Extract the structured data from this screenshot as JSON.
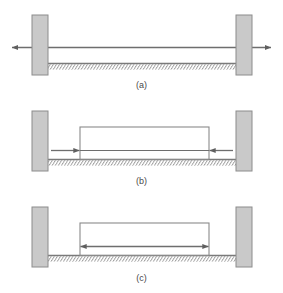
{
  "figure": {
    "title": "",
    "panels": [
      {
        "id": "panel-a",
        "caption": "(a)",
        "description": "unloaded bar between two fixed supports with double-headed axis arrow",
        "arrow_mode": "double-outward-axis",
        "has_member_rect": false
      },
      {
        "id": "panel-b",
        "caption": "(b)",
        "description": "member in compression, arrows point inward toward member ends",
        "arrow_mode": "inward",
        "has_member_rect": true
      },
      {
        "id": "panel-c",
        "caption": "(c)",
        "description": "member in tension, arrows point outward from member center",
        "arrow_mode": "outward",
        "has_member_rect": true
      }
    ],
    "colors": {
      "support_fill": "#c9c9c9",
      "support_stroke": "#8c8c8c",
      "line": "#6e6e6e",
      "member_stroke": "#8a8a8a",
      "ground_stroke": "#7a7a7a",
      "hatch_stroke": "#8a8a8a",
      "caption": "#4a4a4a",
      "background": "#ffffff"
    },
    "geometry": {
      "canvas_width": 283,
      "canvas_height": 293,
      "left_support_x": 32,
      "left_support_width": 16,
      "right_support_x": 236,
      "right_support_width": 16,
      "member_left_x": 80,
      "member_right_x": 209
    }
  }
}
